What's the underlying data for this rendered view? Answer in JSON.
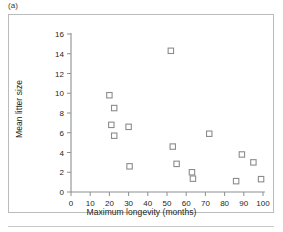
{
  "figure": {
    "panel_label": "(a)",
    "background_color": "#ffffff",
    "frame_color": "#b9bbbd",
    "marker_color": "#8a8c8e",
    "axis_color": "#8c8e90",
    "text_color": "#231f20"
  },
  "chart_data": {
    "type": "scatter",
    "title": "",
    "subtitle": "",
    "panel": "(a)",
    "xlabel": "Maximum longevity (months)",
    "ylabel": "Mean litter size",
    "xlim": [
      0,
      100
    ],
    "ylim": [
      0,
      16
    ],
    "xticks": [
      0,
      10,
      20,
      30,
      40,
      50,
      60,
      70,
      80,
      90,
      100
    ],
    "yticks": [
      0,
      2,
      4,
      6,
      8,
      10,
      12,
      14,
      16
    ],
    "xtick_labels": [
      "0",
      "10",
      "20",
      "30",
      "40",
      "50",
      "60",
      "70",
      "80",
      "90",
      "100"
    ],
    "ytick_labels": [
      "0",
      "2",
      "4",
      "6",
      "8",
      "10",
      "12",
      "14",
      "16"
    ],
    "grid": false,
    "legend": null,
    "legend_position": "none",
    "marker_shape": "open-square",
    "series": [
      {
        "name": "species",
        "points": [
          {
            "x": 20.0,
            "y": 9.8
          },
          {
            "x": 22.5,
            "y": 8.5
          },
          {
            "x": 21.0,
            "y": 6.8
          },
          {
            "x": 22.5,
            "y": 5.7
          },
          {
            "x": 30.0,
            "y": 6.6
          },
          {
            "x": 30.5,
            "y": 2.6
          },
          {
            "x": 52.0,
            "y": 14.3
          },
          {
            "x": 53.0,
            "y": 4.6
          },
          {
            "x": 55.0,
            "y": 2.85
          },
          {
            "x": 63.0,
            "y": 2.0
          },
          {
            "x": 63.5,
            "y": 1.35
          },
          {
            "x": 72.0,
            "y": 5.9
          },
          {
            "x": 86.0,
            "y": 1.1
          },
          {
            "x": 89.0,
            "y": 3.8
          },
          {
            "x": 95.0,
            "y": 3.0
          },
          {
            "x": 99.0,
            "y": 1.3
          }
        ]
      }
    ]
  }
}
